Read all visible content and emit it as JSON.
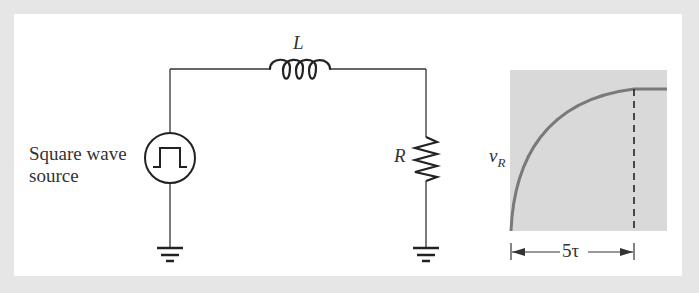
{
  "diagram": {
    "type": "RL circuit with square wave source and resistor voltage response",
    "components": {
      "source": {
        "label_line1": "Square wave",
        "label_line2": "source",
        "icon": "square-wave-source-icon"
      },
      "inductor": {
        "label": "L"
      },
      "resistor": {
        "label": "R"
      },
      "grounds": [
        "ground-left",
        "ground-right"
      ]
    },
    "graph": {
      "y_label": "v",
      "y_label_sub": "R",
      "span_label": "5τ",
      "curve": "exponential rise to steady state",
      "background_color": "#d9d9d9",
      "curve_color": "#7a7a7a"
    }
  },
  "colors": {
    "frame": "#e6e6e6",
    "panel": "#ffffff",
    "wire": "#333333"
  }
}
